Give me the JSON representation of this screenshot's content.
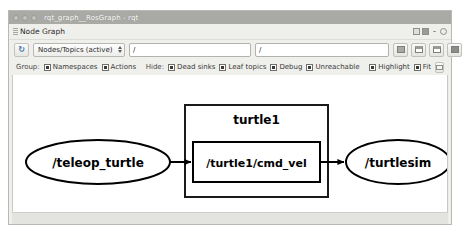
{
  "window": {
    "title": "rqt_graph__RosGraph - rqt",
    "controls": [
      "minimize",
      "maximize",
      "close"
    ]
  },
  "plugin_bar": {
    "title": "Node Graph",
    "grip_icon": "drag-grip-icon",
    "dock_float_icon": "dock-float-icon",
    "dock_settings_icon": "dock-settings-icon",
    "minimize_label": "-",
    "close_icon": "close-icon"
  },
  "toolbar": {
    "refresh_icon": "refresh-icon",
    "refresh_glyph": "↻",
    "graph_type": {
      "selected": "Nodes/Topics (active)",
      "options": [
        "Nodes only",
        "Nodes/Topics (active)",
        "Nodes/Topics (all)"
      ]
    },
    "include_field": {
      "value": "/",
      "placeholder": "/"
    },
    "exclude_field": {
      "value": "/",
      "placeholder": "/"
    },
    "buttons": [
      {
        "name": "fit-in-view-button",
        "icon": "fit-in-view-icon"
      },
      {
        "name": "save-as-image-button",
        "icon": "save-image-icon"
      },
      {
        "name": "save-as-dot-button",
        "icon": "save-dot-icon"
      },
      {
        "name": "load-dot-button",
        "icon": "load-dot-icon"
      }
    ]
  },
  "filter_bar": {
    "group_label": "Group:",
    "group_options": [
      {
        "label": "Namespaces",
        "checked": true
      },
      {
        "label": "Actions",
        "checked": true
      }
    ],
    "hide_label": "Hide:",
    "hide_options": [
      {
        "label": "Dead sinks",
        "checked": true
      },
      {
        "label": "Leaf topics",
        "checked": true
      },
      {
        "label": "Debug",
        "checked": true
      },
      {
        "label": "Unreachable",
        "checked": true
      }
    ],
    "view_options": [
      {
        "label": "Highlight",
        "checked": true
      },
      {
        "label": "Fit",
        "checked": true
      }
    ],
    "extra_button": {
      "name": "auto-fit-button",
      "icon": "auto-fit-icon"
    }
  },
  "graph": {
    "nodes": [
      {
        "id": "teleop_turtle",
        "label": "/teleop_turtle",
        "shape": "ellipse",
        "cx": 85,
        "cy": 87,
        "rx": 72,
        "ry": 22,
        "font_size": 12
      },
      {
        "id": "turtlesim",
        "label": "/turtlesim",
        "shape": "ellipse",
        "cx": 385,
        "cy": 87,
        "rx": 52,
        "ry": 22,
        "font_size": 12
      }
    ],
    "clusters": [
      {
        "id": "turtle1",
        "label": "turtle1",
        "x": 172,
        "y": 30,
        "width": 143,
        "height": 92,
        "label_font_size": 12
      }
    ],
    "topics": [
      {
        "id": "turtle1_cmd_vel",
        "label": "/turtle1/cmd_vel",
        "shape": "rect",
        "x": 180,
        "y": 67,
        "width": 127,
        "height": 40,
        "font_size": 11
      }
    ],
    "edges": [
      {
        "from": "teleop_turtle",
        "to": "turtle1_cmd_vel"
      },
      {
        "from": "turtle1_cmd_vel",
        "to": "turtlesim"
      }
    ]
  },
  "colors": {
    "titlebar": "#a9a9a6",
    "chrome": "#efefec",
    "canvas": "#ffffff",
    "node_stroke": "#000000",
    "text": "#000000"
  }
}
